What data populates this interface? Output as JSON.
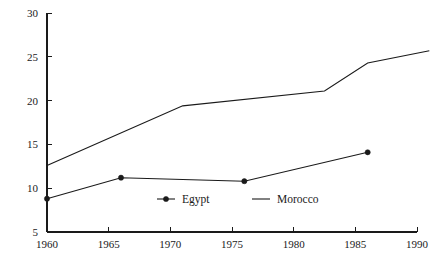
{
  "chart_data": {
    "type": "line",
    "title": "",
    "subtitle": "",
    "xlabel": "",
    "ylabel": "",
    "xlim": [
      1960,
      1990
    ],
    "ylim": [
      5,
      30
    ],
    "grid": false,
    "legend_position": "inside-bottom-center",
    "x_ticks": [
      1960,
      1965,
      1970,
      1975,
      1980,
      1985,
      1990
    ],
    "x_tick_labels": [
      "1960",
      "1965",
      "1970",
      "1975",
      "1980",
      "1985",
      "1990"
    ],
    "y_ticks": [
      5,
      10,
      15,
      20,
      25,
      30
    ],
    "y_tick_labels": [
      "5",
      "10",
      "15",
      "20",
      "25",
      "30"
    ],
    "series": [
      {
        "name": "Egypt",
        "marker": "filled-circle",
        "color": "#1a1a1a",
        "x": [
          1960,
          1966,
          1976,
          1986
        ],
        "values": [
          8.8,
          11.2,
          10.8,
          14.1
        ]
      },
      {
        "name": "Morocco",
        "marker": "none",
        "color": "#1a1a1a",
        "x": [
          1960,
          1971,
          1982.5,
          1986,
          1991
        ],
        "values": [
          12.6,
          19.4,
          21.1,
          24.3,
          25.7
        ]
      }
    ],
    "legend": [
      {
        "label": "Egypt",
        "marker": "filled-circle",
        "line": true
      },
      {
        "label": "Morocco",
        "marker": "none",
        "line": true
      }
    ]
  }
}
